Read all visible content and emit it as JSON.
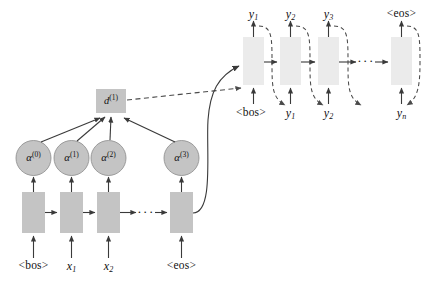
{
  "figure": {
    "type": "diagram",
    "colors": {
      "encoder_box_fill": "#c4c4c4",
      "decoder_box_fill": "#ebebeb",
      "attention_node_fill": "#c4c4c4",
      "context_box_fill": "#c4c4c4",
      "stroke": "#3a3a3a",
      "dashed_stroke": "#4a4a4a",
      "text": "#111111",
      "background": "#ffffff"
    }
  },
  "encoder": {
    "name": "encoder-rnn",
    "inputs": [
      {
        "label": "<bos>",
        "kind": "token"
      },
      {
        "label": "x",
        "sub": "1",
        "kind": "math"
      },
      {
        "label": "x",
        "sub": "2",
        "kind": "math"
      },
      {
        "label": "<eos>",
        "kind": "token"
      }
    ],
    "cells": [
      {
        "name": "encoder-cell-0"
      },
      {
        "name": "encoder-cell-1"
      },
      {
        "name": "encoder-cell-2"
      },
      {
        "name": "encoder-cell-3"
      }
    ],
    "ellipsis": "···"
  },
  "attention": {
    "name": "attention-weights",
    "nodes": [
      {
        "base": "α",
        "sup": "(0)"
      },
      {
        "base": "α",
        "sup": "(1)"
      },
      {
        "base": "α",
        "sup": "(2)"
      },
      {
        "base": "α",
        "sup": "(3)"
      }
    ],
    "context": {
      "base": "d",
      "sup": "(1)"
    }
  },
  "decoder": {
    "name": "decoder-rnn",
    "cells": [
      {
        "name": "decoder-cell-0"
      },
      {
        "name": "decoder-cell-1"
      },
      {
        "name": "decoder-cell-2"
      },
      {
        "name": "decoder-cell-3"
      }
    ],
    "outputs": [
      {
        "label": "y",
        "sub": "1",
        "kind": "math"
      },
      {
        "label": "y",
        "sub": "2",
        "kind": "math"
      },
      {
        "label": "y",
        "sub": "3",
        "kind": "math"
      },
      {
        "label": "<eos>",
        "kind": "token"
      }
    ],
    "inputs": [
      {
        "label": "<bos>",
        "kind": "token"
      },
      {
        "label": "y",
        "sub": "1",
        "kind": "math"
      },
      {
        "label": "y",
        "sub": "2",
        "kind": "math"
      },
      {
        "label": "y",
        "sub": "n",
        "kind": "math"
      }
    ],
    "ellipsis": "···"
  }
}
